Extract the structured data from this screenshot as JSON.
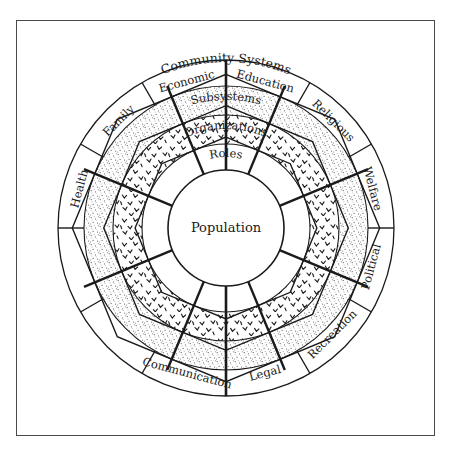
{
  "diagram": {
    "title": "Community Systems",
    "center_label": "Population",
    "ring_labels": [
      {
        "name": "roles",
        "text": "Roles"
      },
      {
        "name": "organizations",
        "text": "Organizations"
      },
      {
        "name": "subsystems",
        "text": "Subsystems"
      }
    ],
    "outer_sectors": [
      {
        "text": "Health",
        "angle": -75
      },
      {
        "text": "Family",
        "angle": -45
      },
      {
        "text": "Economic",
        "angle": -15
      },
      {
        "text": "Education",
        "angle": 15
      },
      {
        "text": "Religious",
        "angle": 45
      },
      {
        "text": "Welfare",
        "angle": 75
      },
      {
        "text": "Political",
        "angle": 105
      },
      {
        "text": "Recreation",
        "angle": 135
      },
      {
        "text": "Legal",
        "angle": 165
      },
      {
        "text": "Communication",
        "angle": 195
      }
    ],
    "geometry": {
      "cx": 226,
      "cy": 228,
      "r_center": 58,
      "r_roles": 84,
      "r_organizations": 113,
      "r_subsystems": 142,
      "r_outer": 168,
      "inner_spokes": 8,
      "outer_spokes": 12
    },
    "colors": {
      "line": "#1a1a1a",
      "frame": "#4a4a4a",
      "background": "#ffffff",
      "stipple": "#6b6b6b"
    }
  }
}
